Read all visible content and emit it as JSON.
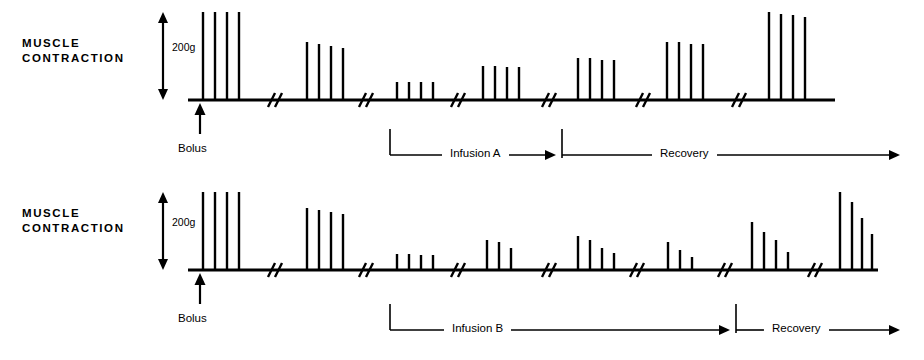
{
  "figure": {
    "background": "#ffffff",
    "ink": "#000000",
    "width": 924,
    "height": 360
  },
  "panels": [
    {
      "id": "panel-a",
      "axis_label": "MUSCLE\nCONTRACTION",
      "scale_label": "200g",
      "bolus_label": "Bolus",
      "infusion_label": "Infusion A",
      "recovery_label": "Recovery",
      "baseline_y": 100,
      "baseline_x0": 188,
      "baseline_x1": 835,
      "scale_top_y": 12,
      "scale_bottom_y": 100,
      "scale_x": 163,
      "label_x": 22,
      "label_y": 36,
      "bolus_x": 200,
      "anno_y": 155,
      "anno_bracket_x": 390,
      "anno_infusion_arrow_end": 556,
      "anno_divider_x": 562,
      "anno_recovery_arrow_end": 900
    },
    {
      "id": "panel-b",
      "axis_label": "MUSCLE\nCONTRACTION",
      "scale_label": "200g",
      "bolus_label": "Bolus",
      "infusion_label": "Infusion B",
      "recovery_label": "Recovery",
      "baseline_y": 270,
      "baseline_x0": 188,
      "baseline_x1": 878,
      "scale_top_y": 192,
      "scale_bottom_y": 270,
      "scale_x": 163,
      "label_x": 22,
      "label_y": 206,
      "bolus_x": 200,
      "anno_y": 330,
      "anno_bracket_x": 390,
      "anno_infusion_arrow_end": 730,
      "anno_divider_x": 736,
      "anno_recovery_arrow_end": 900
    }
  ],
  "chart_data": {
    "type": "line",
    "ylabel": "MUSCLE CONTRACTION",
    "xlabel": "",
    "y_scale_bar": "200g",
    "series": [
      {
        "name": "Panel A - Infusion A",
        "phases": [
          {
            "phase": "Baseline (Bolus)",
            "group_index": 0,
            "spike_x": [
              203,
              215,
              227,
              239
            ],
            "spike_height_px": [
              88,
              88,
              88,
              88
            ],
            "spike_force_g": [
              200,
              200,
              200,
              200
            ]
          },
          {
            "phase": "Baseline",
            "group_index": 1,
            "spike_x": [
              307,
              319,
              331,
              343
            ],
            "spike_height_px": [
              58,
              56,
              54,
              52
            ],
            "spike_force_g": [
              132,
              127,
              123,
              118
            ]
          },
          {
            "phase": "Infusion A",
            "group_index": 2,
            "spike_x": [
              397,
              409,
              421,
              433
            ],
            "spike_height_px": [
              18,
              18,
              18,
              18
            ],
            "spike_force_g": [
              41,
              41,
              41,
              41
            ]
          },
          {
            "phase": "Infusion A",
            "group_index": 3,
            "spike_x": [
              483,
              495,
              507,
              519
            ],
            "spike_height_px": [
              34,
              34,
              33,
              33
            ],
            "spike_force_g": [
              77,
              77,
              75,
              75
            ]
          },
          {
            "phase": "Recovery",
            "group_index": 4,
            "spike_x": [
              578,
              590,
              602,
              614
            ],
            "spike_height_px": [
              42,
              42,
              40,
              40
            ],
            "spike_force_g": [
              95,
              95,
              91,
              91
            ]
          },
          {
            "phase": "Recovery",
            "group_index": 5,
            "spike_x": [
              667,
              679,
              691,
              703
            ],
            "spike_height_px": [
              58,
              58,
              56,
              56
            ],
            "spike_force_g": [
              132,
              132,
              127,
              127
            ]
          },
          {
            "phase": "Recovery",
            "group_index": 6,
            "spike_x": [
              769,
              781,
              793,
              805
            ],
            "spike_height_px": [
              88,
              86,
              85,
              83
            ],
            "spike_force_g": [
              200,
              195,
              193,
              189
            ]
          }
        ],
        "breaks_x": [
          272,
          363,
          455,
          546,
          640,
          736
        ]
      },
      {
        "name": "Panel B - Infusion B",
        "phases": [
          {
            "phase": "Baseline (Bolus)",
            "group_index": 0,
            "spike_x": [
              203,
              215,
              227,
              239
            ],
            "spike_height_px": [
              78,
              78,
              78,
              78
            ],
            "spike_force_g": [
              200,
              200,
              200,
              200
            ]
          },
          {
            "phase": "Baseline",
            "group_index": 1,
            "spike_x": [
              307,
              319,
              331,
              343
            ],
            "spike_height_px": [
              62,
              60,
              58,
              56
            ],
            "spike_force_g": [
              159,
              154,
              149,
              144
            ]
          },
          {
            "phase": "Infusion B",
            "group_index": 2,
            "spike_x": [
              397,
              409,
              421,
              433
            ],
            "spike_height_px": [
              16,
              16,
              15,
              15
            ],
            "spike_force_g": [
              41,
              41,
              38,
              38
            ]
          },
          {
            "phase": "Infusion B",
            "group_index": 3,
            "spike_x": [
              487,
              499,
              511
            ],
            "spike_height_px": [
              30,
              28,
              22
            ],
            "spike_force_g": [
              77,
              72,
              56
            ]
          },
          {
            "phase": "Infusion B",
            "group_index": 4,
            "spike_x": [
              578,
              590,
              602,
              614
            ],
            "spike_height_px": [
              34,
              30,
              22,
              17
            ],
            "spike_force_g": [
              87,
              77,
              56,
              44
            ]
          },
          {
            "phase": "Infusion B",
            "group_index": 5,
            "spike_x": [
              668,
              680,
              692
            ],
            "spike_height_px": [
              28,
              20,
              13
            ],
            "spike_force_g": [
              72,
              51,
              33
            ]
          },
          {
            "phase": "Infusion B",
            "group_index": 6,
            "spike_x": [
              752,
              764,
              776,
              788
            ],
            "spike_height_px": [
              48,
              38,
              30,
              18
            ],
            "spike_force_g": [
              123,
              97,
              77,
              46
            ]
          },
          {
            "phase": "Recovery",
            "group_index": 7,
            "spike_x": [
              840,
              852,
              862,
              872
            ],
            "spike_height_px": [
              78,
              68,
              52,
              36
            ],
            "spike_force_g": [
              200,
              174,
              133,
              92
            ]
          }
        ],
        "breaks_x": [
          272,
          363,
          455,
          546,
          634,
          722,
          812
        ]
      }
    ]
  }
}
